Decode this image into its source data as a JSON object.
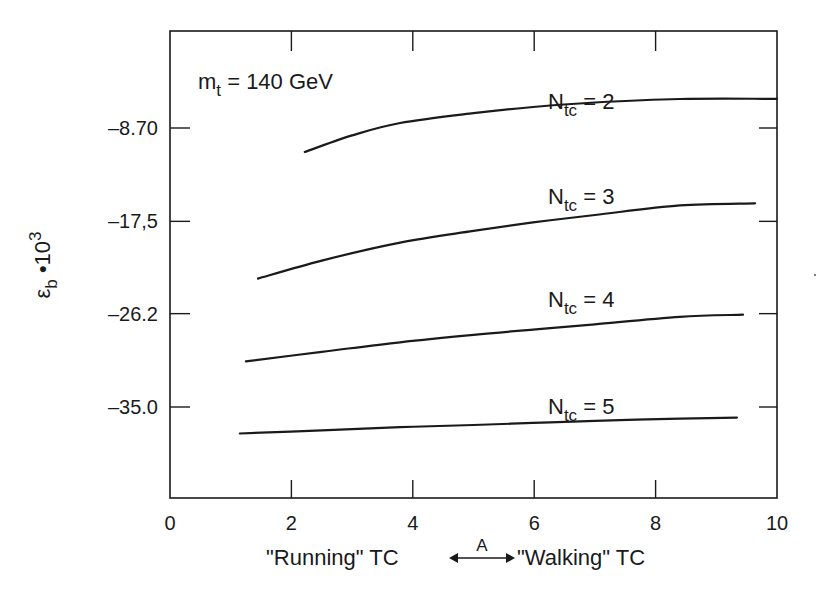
{
  "chart_data": {
    "type": "line",
    "title": "",
    "annotation": {
      "main": "m",
      "sub": "t",
      "rest": " = 140 GeV"
    },
    "xlabel": {
      "left": "\"Running\" TC",
      "arrow_label": "A",
      "right": "\"Walking\" TC"
    },
    "ylabel": {
      "main": "ε",
      "sub": "b",
      "rest": " •10",
      "sup": "3"
    },
    "xlim": [
      0,
      10
    ],
    "ylim": [
      -46.1,
      1.0
    ],
    "x_ticks": [
      {
        "value": 0,
        "label": "0"
      },
      {
        "value": 2,
        "label": "2"
      },
      {
        "value": 4,
        "label": "4"
      },
      {
        "value": 6,
        "label": "6"
      },
      {
        "value": 8,
        "label": "8"
      },
      {
        "value": 10,
        "label": "10"
      }
    ],
    "y_ticks": [
      {
        "value": -8.7,
        "label": "–8.70"
      },
      {
        "value": -17.5,
        "label": "–17,5"
      },
      {
        "value": -26.2,
        "label": "–26.2"
      },
      {
        "value": -35.0,
        "label": "–35.0"
      }
    ],
    "grid": false,
    "legend": "inline labels above each curve",
    "series": [
      {
        "name": "N_tc = 2",
        "label_main": "N",
        "label_sub": "tc",
        "label_rest": " = 2",
        "x": [
          2.22,
          3.0,
          3.79,
          5.0,
          5.98,
          7.0,
          8.4,
          10.0
        ],
        "y": [
          -10.96,
          -9.4,
          -8.23,
          -7.3,
          -6.72,
          -6.3,
          -5.97,
          -5.95
        ]
      },
      {
        "name": "N_tc = 3",
        "label_main": "N",
        "label_sub": "tc",
        "label_rest": " = 3",
        "x": [
          1.45,
          2.5,
          3.79,
          5.0,
          5.98,
          7.0,
          8.4,
          9.64
        ],
        "y": [
          -22.9,
          -21.2,
          -19.5,
          -18.4,
          -17.6,
          -16.9,
          -16.0,
          -15.8
        ]
      },
      {
        "name": "N_tc = 4",
        "label_main": "N",
        "label_sub": "tc",
        "label_rest": " = 4",
        "x": [
          1.25,
          2.5,
          3.79,
          5.0,
          5.98,
          7.0,
          8.4,
          9.44
        ],
        "y": [
          -30.7,
          -29.8,
          -28.9,
          -28.2,
          -27.7,
          -27.2,
          -26.5,
          -26.3
        ]
      },
      {
        "name": "N_tc = 5",
        "label_main": "N",
        "label_sub": "tc",
        "label_rest": " = 5",
        "x": [
          1.15,
          2.5,
          3.79,
          5.0,
          5.98,
          7.0,
          8.4,
          9.34
        ],
        "y": [
          -37.5,
          -37.2,
          -36.9,
          -36.7,
          -36.5,
          -36.3,
          -36.1,
          -36.0
        ]
      }
    ]
  },
  "colors": {
    "ink": "#1a1a1a",
    "background": "#ffffff"
  }
}
